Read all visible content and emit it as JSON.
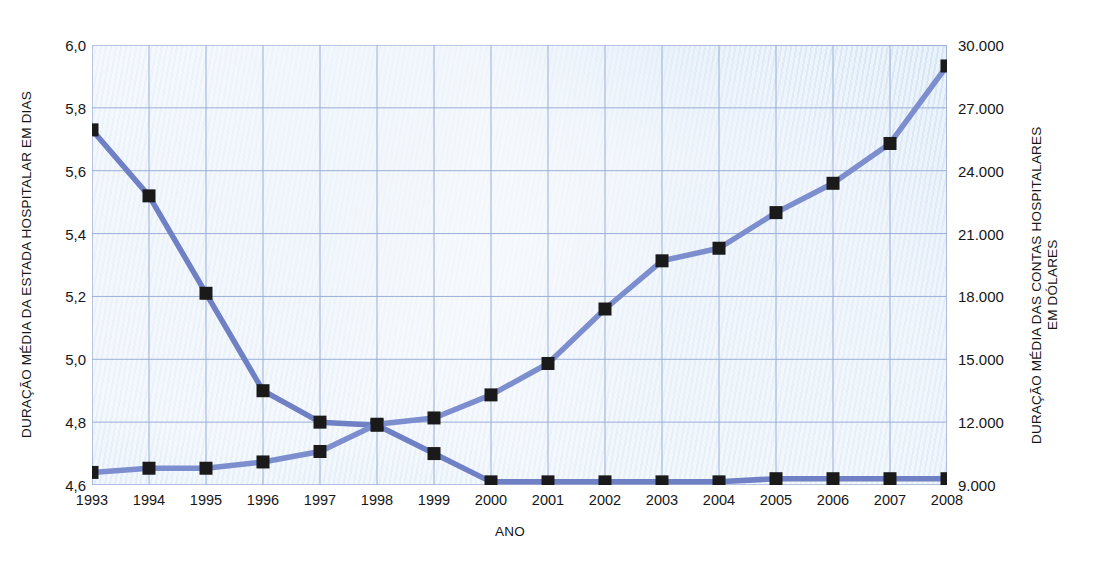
{
  "chart_data": {
    "type": "line",
    "title": "",
    "xlabel": "ANO",
    "ylabel_left": "DURAÇÃO MÉDIA DA ESTADA HOSPITALAR EM DIAS",
    "ylabel_right": "DURAÇÃO MÉDIA DAS CONTAS HOSPITALARES EM DÓLARES",
    "categories": [
      "1993",
      "1994",
      "1995",
      "1996",
      "1997",
      "1998",
      "1999",
      "2000",
      "2001",
      "2002",
      "2003",
      "2004",
      "2005",
      "2006",
      "2007",
      "2008"
    ],
    "x": [
      1993,
      1994,
      1995,
      1996,
      1997,
      1998,
      1999,
      2000,
      2001,
      2002,
      2003,
      2004,
      2005,
      2006,
      2007,
      2008
    ],
    "grid": true,
    "legend": "none",
    "axis_left": {
      "ylim": [
        4.6,
        6.0
      ],
      "ticks": [
        "4,6",
        "4,8",
        "5,0",
        "5,2",
        "5,4",
        "5,6",
        "5,8",
        "6,0"
      ],
      "tick_values": [
        4.6,
        4.8,
        5.0,
        5.2,
        5.4,
        5.6,
        5.8,
        6.0
      ]
    },
    "axis_right": {
      "ylim": [
        9000,
        30000
      ],
      "ticks": [
        "9.000",
        "12.000",
        "15.000",
        "18.000",
        "21.000",
        "24.000",
        "27.000",
        "30.000"
      ],
      "tick_values": [
        9000,
        12000,
        15000,
        18000,
        21000,
        24000,
        27000,
        30000
      ]
    },
    "series": [
      {
        "name": "DURAÇÃO MÉDIA DA ESTADA HOSPITALAR EM DIAS",
        "axis": "left",
        "color": "#6f81c4",
        "marker": "square",
        "marker_color": "#1a1a1a",
        "values": [
          5.73,
          5.52,
          5.21,
          4.9,
          4.8,
          4.79,
          4.7,
          4.61,
          4.61,
          4.61,
          4.61,
          4.61,
          4.62,
          4.62,
          4.62,
          4.62
        ]
      },
      {
        "name": "DURAÇÃO MÉDIA DAS CONTAS HOSPITALARES EM DÓLARES",
        "axis": "right",
        "color": "#7d8ece",
        "marker": "square",
        "marker_color": "#1a1a1a",
        "values": [
          9600,
          9800,
          9800,
          10100,
          10600,
          11900,
          12200,
          13300,
          14800,
          17400,
          19700,
          20300,
          22000,
          23400,
          25300,
          29000
        ]
      }
    ]
  },
  "colors": {
    "plot_background": "#e7f0fa",
    "grid_line": "#9aaed6",
    "plot_border": "#9fb2d8",
    "line_primary": "#6f81c4",
    "line_secondary": "#7d8ece",
    "marker": "#1a1a1a",
    "text": "#161616"
  }
}
